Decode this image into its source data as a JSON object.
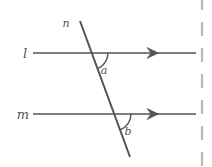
{
  "figure": {
    "type": "geometry-diagram",
    "background_color": "#ffffff",
    "stroke_color": "#555258",
    "labels": {
      "parallel_line_upper": "l",
      "parallel_line_lower": "m",
      "transversal": "n",
      "angle_upper": "a",
      "angle_lower": "b"
    },
    "geometry": {
      "line_l": {
        "x1": 33,
        "y1": 53,
        "x2": 196,
        "y2": 53
      },
      "line_m": {
        "x1": 33,
        "y1": 114,
        "x2": 196,
        "y2": 114
      },
      "transversal_n": {
        "x1": 80,
        "y1": 21,
        "x2": 130,
        "y2": 157
      },
      "intersection_l": {
        "x": 91,
        "y": 53
      },
      "intersection_m": {
        "x": 114,
        "y": 114
      },
      "arrow_l": {
        "x": 155,
        "y": 53
      },
      "arrow_m": {
        "x": 155,
        "y": 114
      },
      "arc_radius": 17
    },
    "label_positions": {
      "l": {
        "x": 25,
        "y": 58
      },
      "m": {
        "x": 19,
        "y": 119
      },
      "n": {
        "x": 63,
        "y": 27
      },
      "a": {
        "x": 104,
        "y": 70
      },
      "b": {
        "x": 127,
        "y": 131
      }
    },
    "page_edge_rule": {
      "x": 202,
      "dash_pattern": "14 12",
      "color": "#b8b6b8"
    }
  }
}
